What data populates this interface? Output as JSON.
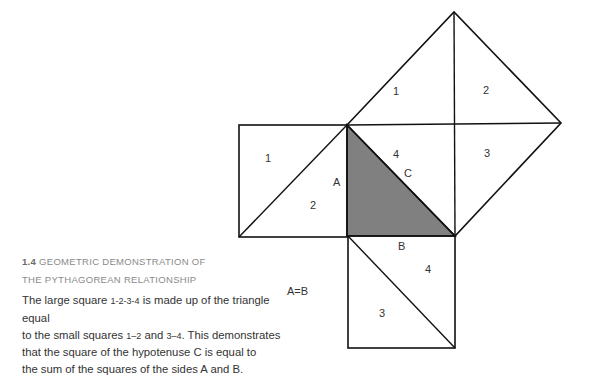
{
  "figure": {
    "colors": {
      "stroke": "#111111",
      "triangle_fill": "#808080",
      "background": "#ffffff"
    },
    "region_labels": {
      "top_square": [
        "1",
        "2",
        "4",
        "3"
      ],
      "left_square": [
        "1",
        "2"
      ],
      "bottom_square": [
        "4",
        "3"
      ]
    },
    "side_labels": {
      "a": "A",
      "b": "B",
      "c": "C"
    },
    "equation": "A=B"
  },
  "caption": {
    "number": "1.4",
    "title_line1": "GEOMETRIC DEMONSTRATION OF",
    "title_line2": "THE PYTHAGOREAN RELATIONSHIP",
    "body": {
      "line1_pre": "The large square ",
      "line1_ref": "1-2-3-4",
      "line1_post": " is made up of the triangle equal",
      "line2_pre": "to the small squares ",
      "line2_ref1": "1–2",
      "line2_mid": " and ",
      "line2_ref2": "3–4",
      "line2_post": ". This demonstrates",
      "line3": "that the square of the hypotenuse C is equal to",
      "line4": "the sum of the squares of the sides A and B."
    }
  }
}
